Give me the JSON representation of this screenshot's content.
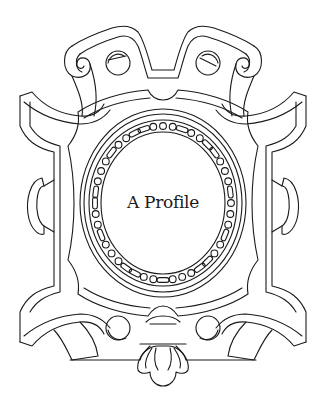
{
  "illustration": {
    "type": "ornamental-cartouche-frame",
    "style": "black line art on white",
    "stroke_color": "#1a1a1a",
    "background_color": "#ffffff"
  },
  "frame": {
    "title": "A Profile"
  }
}
